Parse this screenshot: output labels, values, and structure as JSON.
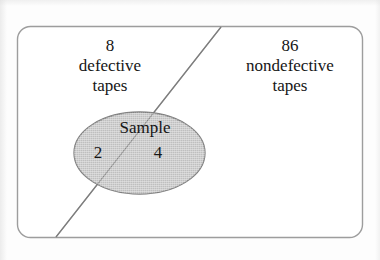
{
  "figure": {
    "type": "venn-style-population-sample-diagram",
    "background_color": "#fdfdfd",
    "outline_color": "#9a9a9a",
    "ellipse_fill_color": "#c8c8c8",
    "text_color": "#161616"
  },
  "population_box": {
    "name": "population-rectangle",
    "left_region": {
      "count": "8",
      "line1": "defective",
      "line2": "tapes"
    },
    "right_region": {
      "count": "86",
      "line1": "nondefective",
      "line2": "tapes"
    }
  },
  "sample_ellipse": {
    "label": "Sample",
    "defective_count": "2",
    "nondefective_count": "4"
  },
  "divider": {
    "name": "defective-nondefective-divider-line"
  }
}
